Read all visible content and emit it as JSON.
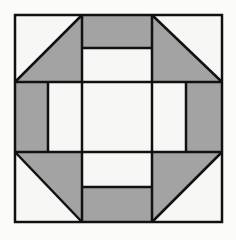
{
  "diagram": {
    "type": "quilt-block",
    "pattern": "churn-dash",
    "grid": "3x3",
    "colors": {
      "background": "#fbfbfa",
      "light": "#f7f7f6",
      "shaded": "#a3a3a3",
      "stroke": "#111111"
    },
    "geometry": {
      "outer": [
        15,
        15,
        222,
        222
      ],
      "third_lines": [
        82,
        152
      ],
      "top_band_split": 48,
      "bottom_band_split": 187,
      "left_band_split": 48,
      "right_band_split": 186
    }
  }
}
